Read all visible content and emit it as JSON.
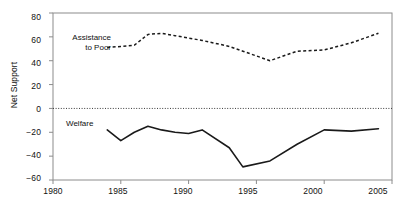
{
  "chart_data": {
    "type": "line",
    "title": "",
    "xlabel": "",
    "ylabel": "Net Support",
    "xlim": [
      1980,
      2005
    ],
    "ylim": [
      -60,
      80
    ],
    "xticks": [
      1980,
      1985,
      1990,
      1995,
      2000,
      2005
    ],
    "yticks": [
      80,
      60,
      40,
      20,
      0,
      -20,
      -40,
      -60
    ],
    "grid": false,
    "zero_line": 0,
    "legend_position": "inline-annotations",
    "series": [
      {
        "name": "Assistance to Poor",
        "style": "dashed",
        "color": "#000000",
        "x": [
          1984,
          1985,
          1986,
          1987,
          1988,
          1989,
          1990,
          1991,
          1993,
          1994,
          1996,
          1998,
          2000,
          2002,
          2004
        ],
        "values": [
          51,
          52,
          53,
          62,
          63,
          61,
          59,
          57,
          52,
          48,
          40,
          48,
          49,
          55,
          63
        ]
      },
      {
        "name": "Welfare",
        "style": "solid",
        "color": "#000000",
        "x": [
          1984,
          1985,
          1986,
          1987,
          1988,
          1989,
          1990,
          1991,
          1993,
          1994,
          1996,
          1998,
          2000,
          2002,
          2004
        ],
        "values": [
          -18,
          -27,
          -20,
          -15,
          -18,
          -20,
          -21,
          -18,
          -33,
          -49,
          -44,
          -30,
          -18,
          -19,
          -17
        ]
      }
    ],
    "annotations": [
      {
        "text": "Assistance\nto Poor",
        "x": 1984,
        "y": 58
      },
      {
        "text": "Welfare",
        "x": 1984,
        "y": -12
      }
    ],
    "axis_labels": {
      "y": "Net Support",
      "x": ""
    },
    "ytick_labels": [
      "80",
      "60",
      "40",
      "20",
      "0",
      "−20",
      "−40",
      "−60"
    ],
    "xtick_labels": [
      "1980",
      "1985",
      "1990",
      "1995",
      "2000",
      "2005"
    ],
    "series_labels": {
      "assistance_line1": "Assistance",
      "assistance_line2": "to Poor",
      "welfare": "Welfare"
    },
    "colors": {
      "axis": "#8c8c8c",
      "line": "#1a1a1a",
      "text": "#111111",
      "background": "#ffffff"
    }
  }
}
